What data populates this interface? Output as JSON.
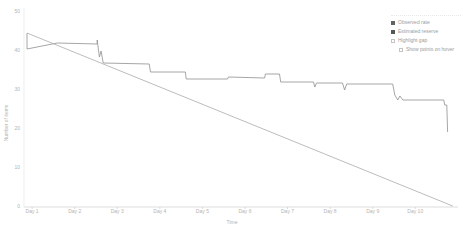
{
  "window": {
    "background": "#ffffff"
  },
  "chart_data": {
    "type": "line",
    "title": "",
    "xlabel": "Time",
    "ylabel": "Number of items",
    "x_ticks": [
      "Day 1",
      "Day 2",
      "Day 3",
      "Day 4",
      "Day 5",
      "Day 6",
      "Day 7",
      "Day 8",
      "Day 9",
      "Day 10"
    ],
    "x_tick_values": [
      1,
      2,
      3,
      4,
      5,
      6,
      7,
      8,
      9,
      10
    ],
    "y_ticks": [
      "0",
      "10",
      "20",
      "30",
      "40",
      "50"
    ],
    "y_tick_values": [
      0,
      10,
      20,
      30,
      40,
      50
    ],
    "x_range": [
      0.81,
      10.98
    ],
    "y_range": [
      0,
      50
    ],
    "grid": false,
    "legend_position": "top-right",
    "series": [
      {
        "name": "Observed rate",
        "style": "step",
        "color": "#8f8f8f",
        "points": [
          [
            0.88,
            44.36
          ],
          [
            0.88,
            40.26
          ],
          [
            1.59,
            41.79
          ],
          [
            2.53,
            41.54
          ],
          [
            2.53,
            42.56
          ],
          [
            2.58,
            38.21
          ],
          [
            2.62,
            39.74
          ],
          [
            2.67,
            36.67
          ],
          [
            3.75,
            36.41
          ],
          [
            3.78,
            34.36
          ],
          [
            4.6,
            34.36
          ],
          [
            4.62,
            32.56
          ],
          [
            5.59,
            32.56
          ],
          [
            5.61,
            33.08
          ],
          [
            6.46,
            32.82
          ],
          [
            6.48,
            33.85
          ],
          [
            6.81,
            33.85
          ],
          [
            6.84,
            31.79
          ],
          [
            7.61,
            31.79
          ],
          [
            7.64,
            30.51
          ],
          [
            7.68,
            31.54
          ],
          [
            8.29,
            31.54
          ],
          [
            8.34,
            29.74
          ],
          [
            8.39,
            31.28
          ],
          [
            9.47,
            31.28
          ],
          [
            9.52,
            28.46
          ],
          [
            9.59,
            27.18
          ],
          [
            9.64,
            28.21
          ],
          [
            9.71,
            27.18
          ],
          [
            10.67,
            27.18
          ],
          [
            10.69,
            25.9
          ],
          [
            10.74,
            25.9
          ],
          [
            10.76,
            18.97
          ]
        ]
      },
      {
        "name": "Estimated reserve",
        "style": "straight",
        "color": "#ababab",
        "points": [
          [
            0.88,
            44.36
          ],
          [
            10.88,
            0
          ]
        ]
      }
    ],
    "axis_line_color": "#cfcfcf",
    "tick_text_color": "#b3b3b3"
  },
  "legend": {
    "items": [
      {
        "label": "Observed rate",
        "swatch": "square",
        "color": "#636363"
      },
      {
        "label": "Estimated reserve",
        "swatch": "square",
        "color": "#575757"
      },
      {
        "label": "Highlight gap",
        "swatch": "checkbox",
        "checked": false
      },
      {
        "label": "Show points on hover",
        "swatch": "checkbox",
        "checked": false,
        "indent": true
      }
    ]
  }
}
